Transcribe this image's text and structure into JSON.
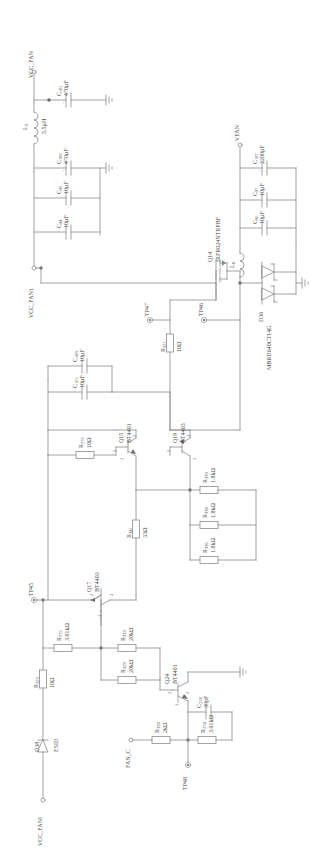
{
  "diagram": {
    "type": "electronic-schematic",
    "orientation": "portrait-rotated-labels"
  },
  "nets": [
    {
      "id": "vcc_fan",
      "name": "VCC_FAN"
    },
    {
      "id": "vcc_fan1",
      "name": "VCC_FAN1"
    },
    {
      "id": "vfan",
      "name": "VFAN"
    },
    {
      "id": "vcc_fani",
      "name": "VCC_FANI"
    },
    {
      "id": "fan_c",
      "name": "FAN_C"
    },
    {
      "id": "esid",
      "name": "ESID"
    }
  ],
  "testpoints": [
    {
      "id": "tp45",
      "name": "TP45"
    },
    {
      "id": "tp46",
      "name": "TP46"
    },
    {
      "id": "tp47",
      "name": "TP47"
    },
    {
      "id": "tp48",
      "name": "TP48"
    }
  ],
  "components": {
    "capacitors": [
      {
        "ref": "C",
        "index": "181",
        "value": "470µF",
        "polarized": true
      },
      {
        "ref": "C",
        "index": "180",
        "value": "470µF",
        "polarized": true
      },
      {
        "ref": "C",
        "index": "95",
        "value": "10µF",
        "polarized": false
      },
      {
        "ref": "C",
        "index": "94",
        "value": "10µF",
        "polarized": false
      },
      {
        "ref": "C",
        "index": "187",
        "value": "2200µF",
        "polarized": true
      },
      {
        "ref": "C",
        "index": "97",
        "value": "10µF",
        "polarized": false
      },
      {
        "ref": "C",
        "index": "96",
        "value": "10µF",
        "polarized": false
      },
      {
        "ref": "C",
        "index": "189",
        "value": "10µF",
        "polarized": false
      },
      {
        "ref": "C",
        "index": "101",
        "value": "10µF",
        "polarized": false
      },
      {
        "ref": "C",
        "index": "218",
        "value": "39pF",
        "polarized": false
      }
    ],
    "inductors": [
      {
        "ref": "L",
        "index": "3",
        "value": "5.5µH"
      },
      {
        "ref": "L",
        "index": "8",
        "value": ""
      }
    ],
    "resistors": [
      {
        "ref": "R",
        "index": "321",
        "value": "10Ω"
      },
      {
        "ref": "R",
        "index": "276",
        "value": "10Ω"
      },
      {
        "ref": "R",
        "index": "341",
        "value": "33Ω"
      },
      {
        "ref": "R",
        "index": "339",
        "value": "1.8kΩ"
      },
      {
        "ref": "R",
        "index": "338",
        "value": "1.8kΩ"
      },
      {
        "ref": "R",
        "index": "336",
        "value": "1.8kΩ"
      },
      {
        "ref": "R",
        "index": "275",
        "value": "3.01kΩ"
      },
      {
        "ref": "R",
        "index": "333",
        "value": "20kΩ"
      },
      {
        "ref": "R",
        "index": "329",
        "value": "20kΩ"
      },
      {
        "ref": "R",
        "index": "323",
        "value": "10Ω"
      },
      {
        "ref": "R",
        "index": "328",
        "value": "2kΩ"
      },
      {
        "ref": "R",
        "index": "274",
        "value": "3.01kΩ"
      }
    ],
    "transistors": [
      {
        "ref": "Q14",
        "part": "IRFR024NTRPBF",
        "type": "mosfet"
      },
      {
        "ref": "Q15",
        "part": "BT4401",
        "type": "npn"
      },
      {
        "ref": "Q19",
        "part": "BT4403",
        "type": "pnp"
      },
      {
        "ref": "Q17",
        "part": "BT4403",
        "type": "pnp"
      },
      {
        "ref": "Q24",
        "part": "BT4401",
        "type": "npn"
      }
    ],
    "diodes": [
      {
        "ref": "D36",
        "part": "MBRD640CT14G",
        "type": "dual-schottky"
      },
      {
        "ref": "D38",
        "part": "ESID",
        "type": "tvs"
      }
    ]
  },
  "pin_numbers": {
    "p1": "1",
    "p2": "2",
    "p3": "3"
  },
  "colors": {
    "wire": "#8c8c8c",
    "text": "#4a4a4a",
    "background": "#ffffff"
  }
}
